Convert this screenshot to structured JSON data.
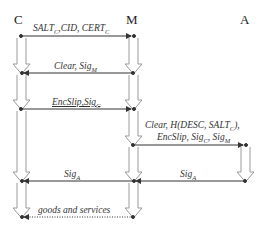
{
  "actors": {
    "c": "C",
    "m": "M",
    "a": "A"
  },
  "messages": [
    {
      "from": "C",
      "to": "M",
      "label": "SALT",
      "sub": "C",
      "rest": ",CID, CERT",
      "rest_sub": "C"
    },
    {
      "from": "M",
      "to": "C",
      "label": "Clear, Sig",
      "sub": "M"
    },
    {
      "from": "C",
      "to": "M",
      "label": "EncSlip,Sig",
      "sub": "C"
    },
    {
      "from": "M",
      "to": "A",
      "line1": "Clear, H(DESC, SALT",
      "line1_sub": "C",
      "line1_end": "),",
      "line2": "EncSlip, Sig",
      "line2_sub": "C",
      "line2_mid": ", Sig",
      "line2_sub2": "M"
    },
    {
      "from": "A",
      "to": "M",
      "label": "Sig",
      "sub": "A"
    },
    {
      "from": "M",
      "to": "C",
      "label": "Sig",
      "sub": "A"
    },
    {
      "from": "M",
      "to": "C",
      "label": "goods and services",
      "style": "dotted"
    }
  ],
  "colors": {
    "line": "#333333",
    "arrow_outline": "#9a9a9a",
    "text": "#333333"
  }
}
